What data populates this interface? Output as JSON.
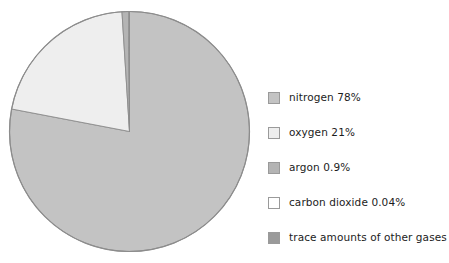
{
  "chart_data": {
    "type": "pie",
    "title": "",
    "subtitle": "",
    "xlabel": "",
    "ylabel": "",
    "legend_position": "right",
    "grid": false,
    "start_angle_deg": 0,
    "direction": "clockwise",
    "categories": [
      "nitrogen",
      "oxygen",
      "argon",
      "carbon dioxide",
      "trace amounts of other gases"
    ],
    "values": [
      78,
      21,
      0.9,
      0.04,
      0.06
    ],
    "value_labels": [
      "78%",
      "21%",
      "0.9%",
      "0.04%",
      ""
    ],
    "colors": [
      "#c3c3c3",
      "#eeeeee",
      "#b4b4b4",
      "#ffffff",
      "#9a9a9a"
    ],
    "slice_edge_color": "#8c8c8c",
    "slices": [
      {
        "name": "nitrogen",
        "value": 78,
        "display_value": "78%",
        "color": "#c3c3c3",
        "start_deg": 0,
        "end_deg": 280.8
      },
      {
        "name": "oxygen",
        "value": 21,
        "display_value": "21%",
        "color": "#eeeeee",
        "start_deg": 280.8,
        "end_deg": 356.4
      },
      {
        "name": "argon",
        "value": 0.9,
        "display_value": "0.9%",
        "color": "#b4b4b4",
        "start_deg": 356.4,
        "end_deg": 359.64
      },
      {
        "name": "carbon dioxide",
        "value": 0.04,
        "display_value": "0.04%",
        "color": "#ffffff",
        "start_deg": 359.64,
        "end_deg": 359.784
      },
      {
        "name": "trace amounts of other gases",
        "value": 0.06,
        "display_value": "",
        "color": "#9a9a9a",
        "start_deg": 359.784,
        "end_deg": 360
      }
    ]
  },
  "legend": {
    "items": [
      {
        "label": "nitrogen 78%",
        "color": "#c3c3c3"
      },
      {
        "label": "oxygen 21%",
        "color": "#eeeeee"
      },
      {
        "label": "argon 0.9%",
        "color": "#b4b4b4"
      },
      {
        "label": "carbon dioxide 0.04%",
        "color": "#ffffff"
      },
      {
        "label": "trace amounts of other gases",
        "color": "#9a9a9a"
      }
    ]
  }
}
